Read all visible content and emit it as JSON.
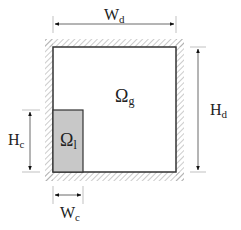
{
  "diagram": {
    "domain_gas_label": "Ω",
    "domain_gas_sub": "g",
    "domain_liquid_label": "Ω",
    "domain_liquid_sub": "l",
    "width_domain_label": "W",
    "width_domain_sub": "d",
    "height_domain_label": "H",
    "height_domain_sub": "d",
    "width_column_label": "W",
    "width_column_sub": "c",
    "height_column_label": "H",
    "height_column_sub": "c"
  },
  "colors": {
    "wall": "#333333",
    "hatch": "#9a9a9a",
    "liquid_fill": "#c8c8c8",
    "dimension_line": "#555555"
  }
}
